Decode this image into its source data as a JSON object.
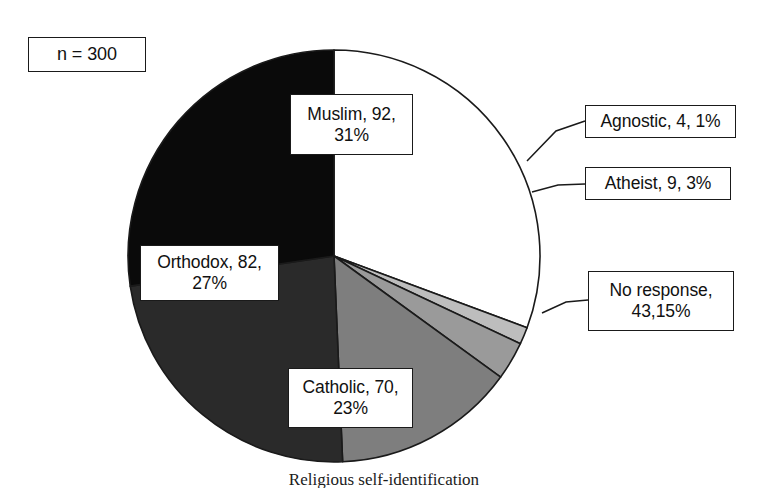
{
  "chart_data": {
    "type": "pie",
    "title": "",
    "caption": "Religious self-identification",
    "sample_size_label": "n = 300",
    "total": 300,
    "start_angle_deg": 0,
    "direction": "clockwise",
    "center": {
      "x": 334,
      "y": 256
    },
    "radius": 206,
    "categories": [
      "Muslim",
      "Agnostic",
      "Atheist",
      "No response",
      "Catholic",
      "Orthodox"
    ],
    "values": [
      92,
      4,
      9,
      43,
      70,
      82
    ],
    "percents": [
      31,
      1,
      3,
      15,
      23,
      27
    ],
    "slices": [
      {
        "name": "Muslim",
        "count": 92,
        "percent": 31,
        "color": "#ffffff",
        "label_lines": [
          "Muslim, 92,",
          "31%"
        ],
        "label_placement": "inside"
      },
      {
        "name": "Agnostic",
        "count": 4,
        "percent": 1,
        "color": "#bdbdbd",
        "label_lines": [
          "Agnostic, 4, 1%"
        ],
        "label_placement": "outside-right"
      },
      {
        "name": "Atheist",
        "count": 9,
        "percent": 3,
        "color": "#9a9a9a",
        "label_lines": [
          "Atheist, 9, 3%"
        ],
        "label_placement": "outside-right"
      },
      {
        "name": "No response",
        "count": 43,
        "percent": 15,
        "color": "#7e7e7e",
        "label_lines": [
          "No response,",
          "43,15%"
        ],
        "label_placement": "outside-right"
      },
      {
        "name": "Catholic",
        "count": 70,
        "percent": 23,
        "color": "#2a2a2a",
        "label_lines": [
          "Catholic, 70,",
          "23%"
        ],
        "label_placement": "inside"
      },
      {
        "name": "Orthodox",
        "count": 82,
        "percent": 27,
        "color": "#0a0a0a",
        "label_lines": [
          "Orthodox, 82,",
          "27%"
        ],
        "label_placement": "inside"
      }
    ],
    "leader_lines": [
      {
        "name": "Agnostic",
        "from": {
          "x": 527,
          "y": 161
        },
        "mid": {
          "x": 556,
          "y": 131
        },
        "to": {
          "x": 585,
          "y": 121
        }
      },
      {
        "name": "Atheist",
        "from": {
          "x": 532,
          "y": 192
        },
        "mid": {
          "x": 558,
          "y": 185
        },
        "to": {
          "x": 585,
          "y": 184
        }
      },
      {
        "name": "No response",
        "from": {
          "x": 542,
          "y": 313
        },
        "mid": {
          "x": 566,
          "y": 302
        },
        "to": {
          "x": 588,
          "y": 300
        }
      }
    ],
    "outline_color": "#1a1a1a",
    "legend": "none",
    "grid": false
  }
}
